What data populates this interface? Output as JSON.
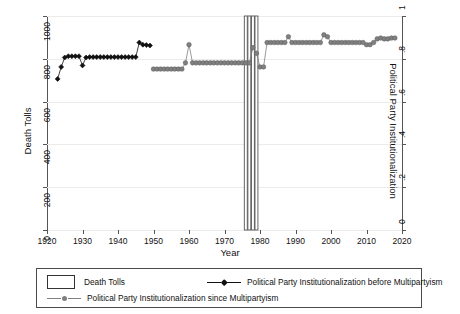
{
  "chart_data": {
    "type": "line",
    "title": "",
    "xlabel": "Year",
    "ylabel_left": "Death Tolls",
    "ylabel_right": "Political Party Institutionalization",
    "xlim": [
      1920,
      2020
    ],
    "ylim_left": [
      0,
      1000
    ],
    "ylim_right": [
      0,
      1
    ],
    "xticks": [
      1920,
      1930,
      1940,
      1950,
      1960,
      1970,
      1980,
      1990,
      2000,
      2010,
      2020
    ],
    "xticklabels": [
      "1920",
      "1930",
      "1940",
      "1950",
      "1960",
      "1970",
      "1980",
      "1990",
      "2000",
      "2010",
      "2020"
    ],
    "yticks_left": [
      0,
      200,
      400,
      600,
      800,
      1000
    ],
    "yticklabels_left": [
      "0",
      "200",
      "400",
      "600",
      "800",
      "1000"
    ],
    "yticks_right": [
      0,
      0.2,
      0.4,
      0.6,
      0.8,
      1
    ],
    "yticklabels_right": [
      "0",
      ".2",
      ".4",
      ".6",
      ".8",
      "1"
    ],
    "grid": true,
    "legend_position": "below-plot",
    "series": [
      {
        "name": "Death Tolls",
        "type": "bar",
        "axis": "left",
        "color": "#ffffff",
        "edge_color": "#555555",
        "x": [
          1976,
          1977,
          1978,
          1979
        ],
        "values": [
          1000,
          1000,
          1000,
          1000
        ]
      },
      {
        "name": "Political Party Institutionalization before Multipartyism",
        "type": "line",
        "axis": "right",
        "color": "#111111",
        "marker": "diamond",
        "x": [
          1923,
          1924,
          1925,
          1926,
          1927,
          1928,
          1929,
          1930,
          1931,
          1932,
          1933,
          1934,
          1935,
          1936,
          1937,
          1938,
          1939,
          1940,
          1941,
          1942,
          1943,
          1944,
          1945,
          1946,
          1947,
          1948,
          1949
        ],
        "values": [
          0.706,
          0.762,
          0.806,
          0.812,
          0.812,
          0.812,
          0.812,
          0.769,
          0.806,
          0.808,
          0.808,
          0.808,
          0.808,
          0.808,
          0.808,
          0.808,
          0.808,
          0.808,
          0.808,
          0.808,
          0.808,
          0.808,
          0.808,
          0.876,
          0.866,
          0.864,
          0.862
        ]
      },
      {
        "name": "Political Party Institutionalization since Multipartyism",
        "type": "line",
        "axis": "right",
        "color": "#808080",
        "marker": "circle",
        "x": [
          1950,
          1951,
          1952,
          1953,
          1954,
          1955,
          1956,
          1957,
          1958,
          1959,
          1960,
          1961,
          1962,
          1963,
          1964,
          1965,
          1966,
          1967,
          1968,
          1969,
          1970,
          1971,
          1972,
          1973,
          1974,
          1975,
          1976,
          1977,
          1978,
          1979,
          1980,
          1981,
          1982,
          1983,
          1984,
          1985,
          1986,
          1987,
          1988,
          1989,
          1990,
          1991,
          1992,
          1993,
          1994,
          1995,
          1996,
          1997,
          1998,
          1999,
          2000,
          2001,
          2002,
          2003,
          2004,
          2005,
          2006,
          2007,
          2008,
          2009,
          2010,
          2011,
          2012,
          2013,
          2014,
          2015,
          2016,
          2017,
          2018
        ],
        "values": [
          0.752,
          0.752,
          0.752,
          0.752,
          0.752,
          0.752,
          0.752,
          0.752,
          0.752,
          0.781,
          0.866,
          0.781,
          0.781,
          0.781,
          0.781,
          0.781,
          0.781,
          0.781,
          0.781,
          0.781,
          0.781,
          0.781,
          0.781,
          0.781,
          0.781,
          0.781,
          0.781,
          0.781,
          0.852,
          0.826,
          0.762,
          0.762,
          0.876,
          0.876,
          0.876,
          0.876,
          0.876,
          0.876,
          0.903,
          0.876,
          0.876,
          0.876,
          0.876,
          0.876,
          0.876,
          0.876,
          0.876,
          0.876,
          0.912,
          0.903,
          0.876,
          0.876,
          0.876,
          0.876,
          0.876,
          0.876,
          0.876,
          0.876,
          0.876,
          0.876,
          0.866,
          0.866,
          0.876,
          0.893,
          0.897,
          0.893,
          0.893,
          0.897,
          0.897
        ]
      }
    ]
  },
  "legend": {
    "items": [
      {
        "key": "death-tolls",
        "style": "box",
        "label": "Death Tolls"
      },
      {
        "key": "ppi-before",
        "style": "line-diamond-black",
        "label": "Political Party Institutionalization before Multipartyism"
      },
      {
        "key": "ppi-since",
        "style": "line-circle-gray",
        "label": "Political Party Institutionalization since Multipartyism"
      }
    ]
  },
  "colors": {
    "black_series": "#111111",
    "gray_series": "#808080",
    "bar_edge": "#555555",
    "grid": "#eceaea",
    "axis": "#555555"
  }
}
